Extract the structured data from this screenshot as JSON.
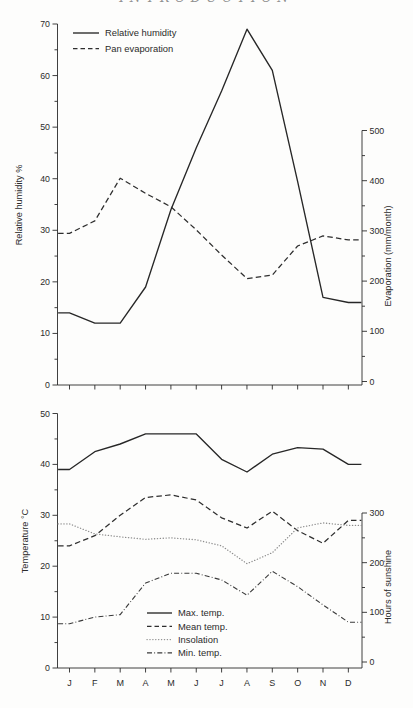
{
  "page": {
    "header": "INTRODUCTION"
  },
  "chart_data": [
    {
      "name": "humidity-evaporation-chart",
      "type": "line",
      "title": "",
      "categories": [
        "J",
        "F",
        "M",
        "A",
        "M",
        "J",
        "J",
        "A",
        "S",
        "O",
        "N",
        "D"
      ],
      "show_x_labels": false,
      "grid": false,
      "legend_position": "top-left-inside",
      "axis_color": "#2a2a2a",
      "left_axis": {
        "label": "Relative humidity %",
        "min": 0,
        "max": 70,
        "major": 10,
        "minor": 5,
        "ticks": [
          0,
          10,
          20,
          30,
          40,
          50,
          60,
          70
        ]
      },
      "right_axis": {
        "label": "Evaporation (mm/month)",
        "min": 0,
        "max": 500,
        "major": 100,
        "minor": 50,
        "ticks": [
          0,
          100,
          200,
          300,
          400,
          500
        ]
      },
      "series": [
        {
          "name": "Relative humidity",
          "axis": "left",
          "style": "solid",
          "color": "#272727",
          "values": [
            14,
            12,
            12,
            19,
            34,
            46,
            57,
            69,
            61,
            39.5,
            17,
            16
          ]
        },
        {
          "name": "Pan evaporation",
          "axis": "right",
          "style": "dashed",
          "color": "#2e2e2e",
          "values": [
            295,
            320,
            405,
            375,
            348,
            302,
            252,
            205,
            212,
            270,
            290,
            282
          ]
        }
      ]
    },
    {
      "name": "temperature-sunshine-chart",
      "type": "line",
      "title": "",
      "categories": [
        "J",
        "F",
        "M",
        "A",
        "M",
        "J",
        "J",
        "A",
        "S",
        "O",
        "N",
        "D"
      ],
      "show_x_labels": true,
      "grid": false,
      "legend_position": "bottom-center-inside",
      "axis_color": "#2a2a2a",
      "left_axis": {
        "label": "Temperature °C",
        "min": 0,
        "max": 50,
        "major": 10,
        "minor": 5,
        "ticks": [
          0,
          10,
          20,
          30,
          40,
          50
        ]
      },
      "right_axis": {
        "label": "Hours of sunshine",
        "min": 0,
        "max": 300,
        "major": 100,
        "minor": 50,
        "ticks": [
          0,
          100,
          200,
          300
        ]
      },
      "series": [
        {
          "name": "Max. temp.",
          "axis": "left",
          "style": "solid",
          "color": "#272727",
          "values": [
            39,
            42.5,
            44,
            46,
            46,
            46,
            41,
            38.5,
            42,
            43.3,
            43,
            40
          ]
        },
        {
          "name": "Mean temp.",
          "axis": "left",
          "style": "dashed",
          "color": "#2e2e2e",
          "values": [
            24,
            26,
            30,
            33.5,
            34,
            33,
            29.5,
            27.5,
            30.8,
            27,
            24.5,
            29
          ]
        },
        {
          "name": "Insolation",
          "axis": "right",
          "style": "dotted",
          "color": "#8d8d8d",
          "values": [
            278,
            258,
            252,
            247,
            250,
            246,
            234,
            198,
            220,
            270,
            280,
            275
          ]
        },
        {
          "name": "Min. temp.",
          "axis": "left",
          "style": "dashdot",
          "color": "#3a3a3a",
          "values": [
            8.7,
            10,
            10.5,
            16.7,
            18.6,
            18.6,
            17.3,
            14.3,
            19,
            16,
            12.4,
            9
          ]
        }
      ]
    }
  ]
}
